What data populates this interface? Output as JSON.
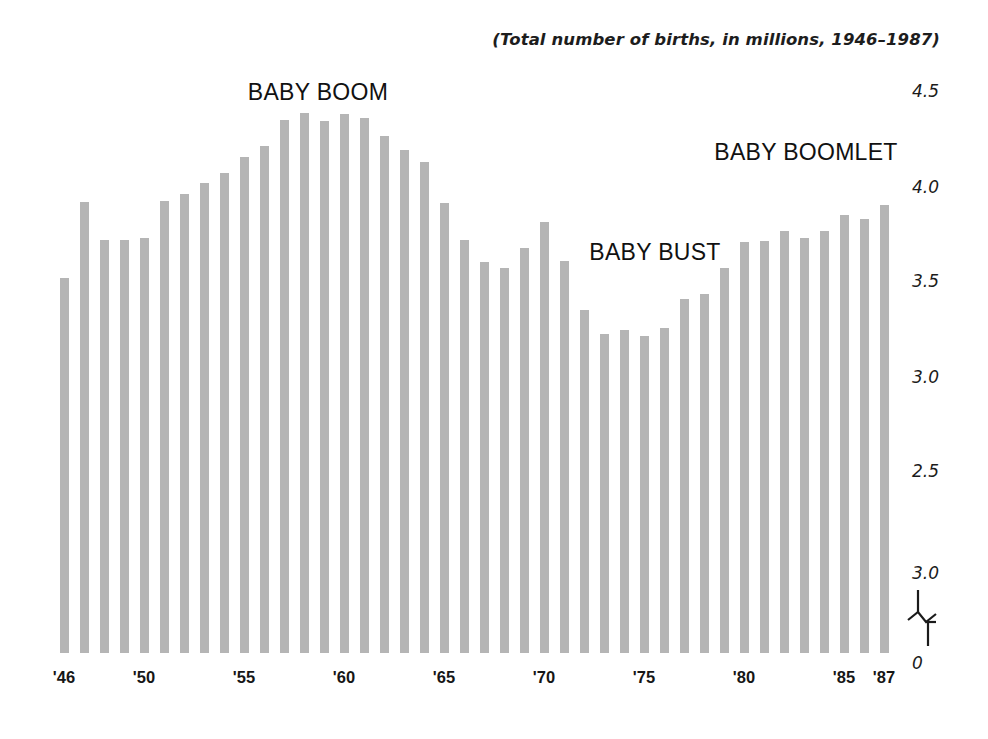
{
  "subtitle": "(Total number of births, in millions, 1946–1987)",
  "colors": {
    "bar": "#b5b5b5",
    "text": "#161616",
    "background": "#ffffff"
  },
  "annotations": [
    {
      "label": "BABY BOOM",
      "x": 318,
      "y": 92
    },
    {
      "label": "BABY BOOMLET",
      "x": 806,
      "y": 152
    },
    {
      "label": "BABY BUST",
      "x": 655,
      "y": 252
    }
  ],
  "y_axis": {
    "ticks": [
      {
        "label": "4.5",
        "y": 91
      },
      {
        "label": "4.0",
        "y": 187
      },
      {
        "label": "3.5",
        "y": 281
      },
      {
        "label": "3.0",
        "y": 377
      },
      {
        "label": "2.5",
        "y": 471
      },
      {
        "label": "3.0",
        "y": 573
      },
      {
        "label": "0",
        "y": 663
      }
    ],
    "has_axis_break": true
  },
  "x_axis": {
    "ticks": [
      {
        "label": "'46",
        "x": 64
      },
      {
        "label": "'50",
        "x": 144
      },
      {
        "label": "'55",
        "x": 244
      },
      {
        "label": "'60",
        "x": 344
      },
      {
        "label": "'65",
        "x": 444
      },
      {
        "label": "'70",
        "x": 544
      },
      {
        "label": "'75",
        "x": 644
      },
      {
        "label": "'80",
        "x": 744
      },
      {
        "label": "'85",
        "x": 844
      },
      {
        "label": "'87",
        "x": 884
      }
    ]
  },
  "chart_data": {
    "type": "bar",
    "title": "",
    "subtitle": "(Total number of births, in millions, 1946–1987)",
    "xlabel": "",
    "ylabel": "",
    "units": "millions of births",
    "ylim": [
      0,
      4.6
    ],
    "grid": false,
    "legend": false,
    "axis_note": "Y axis is broken between the lowest labelled gridline and 0; printed tick sequence reads 4.5, 4.0, 3.5, 3.0, 2.5, 3.0, 0 (the second 3.0 appears to be a typo for 2.0 in the original).",
    "categories": [
      "1946",
      "1947",
      "1948",
      "1949",
      "1950",
      "1951",
      "1952",
      "1953",
      "1954",
      "1955",
      "1956",
      "1957",
      "1958",
      "1959",
      "1960",
      "1961",
      "1962",
      "1963",
      "1964",
      "1965",
      "1966",
      "1967",
      "1968",
      "1969",
      "1970",
      "1971",
      "1972",
      "1973",
      "1974",
      "1975",
      "1976",
      "1977",
      "1978",
      "1979",
      "1980",
      "1981",
      "1982",
      "1983",
      "1984",
      "1985",
      "1986",
      "1987"
    ],
    "tick_labels": [
      "'46",
      "",
      "",
      "",
      "'50",
      "",
      "",
      "",
      "",
      "'55",
      "",
      "",
      "",
      "",
      "'60",
      "",
      "",
      "",
      "",
      "'65",
      "",
      "",
      "",
      "",
      "'70",
      "",
      "",
      "",
      "",
      "'75",
      "",
      "",
      "",
      "",
      "'80",
      "",
      "",
      "",
      "",
      "'85",
      "",
      "'87"
    ],
    "values": [
      3.47,
      3.87,
      3.7,
      3.7,
      3.71,
      3.87,
      3.91,
      3.97,
      4.02,
      4.1,
      4.16,
      4.3,
      4.26,
      4.3,
      4.26,
      4.27,
      4.17,
      4.1,
      4.03,
      3.88,
      3.67,
      3.58,
      3.57,
      3.66,
      3.78,
      3.64,
      3.41,
      3.25,
      3.27,
      3.24,
      3.28,
      3.41,
      3.44,
      3.57,
      3.7,
      3.71,
      3.74,
      3.72,
      3.76,
      3.82,
      3.81,
      3.87
    ]
  },
  "bars": [
    {
      "year": "1946",
      "value": 3.47,
      "x": 60,
      "top": 278
    },
    {
      "year": "1947",
      "value": 3.87,
      "x": 80,
      "top": 202
    },
    {
      "year": "1948",
      "value": 3.7,
      "x": 100,
      "top": 240
    },
    {
      "year": "1949",
      "value": 3.7,
      "x": 120,
      "top": 240
    },
    {
      "year": "1950",
      "value": 3.71,
      "x": 140,
      "top": 238
    },
    {
      "year": "1951",
      "value": 3.87,
      "x": 160,
      "top": 201
    },
    {
      "year": "1952",
      "value": 3.91,
      "x": 180,
      "top": 194
    },
    {
      "year": "1953",
      "value": 3.97,
      "x": 200,
      "top": 183
    },
    {
      "year": "1954",
      "value": 4.02,
      "x": 220,
      "top": 173
    },
    {
      "year": "1955",
      "value": 4.1,
      "x": 240,
      "top": 157
    },
    {
      "year": "1956",
      "value": 4.16,
      "x": 260,
      "top": 146
    },
    {
      "year": "1957",
      "value": 4.3,
      "x": 280,
      "top": 120
    },
    {
      "year": "1958",
      "value": 4.26,
      "x": 300,
      "top": 113
    },
    {
      "year": "1959",
      "value": 4.3,
      "x": 320,
      "top": 121
    },
    {
      "year": "1960",
      "value": 4.26,
      "x": 340,
      "top": 114
    },
    {
      "year": "1961",
      "value": 4.27,
      "x": 360,
      "top": 118
    },
    {
      "year": "1962",
      "value": 4.17,
      "x": 380,
      "top": 136
    },
    {
      "year": "1963",
      "value": 4.1,
      "x": 400,
      "top": 150
    },
    {
      "year": "1964",
      "value": 4.03,
      "x": 420,
      "top": 162
    },
    {
      "year": "1965",
      "value": 3.88,
      "x": 440,
      "top": 203
    },
    {
      "year": "1966",
      "value": 3.67,
      "x": 460,
      "top": 240
    },
    {
      "year": "1967",
      "value": 3.58,
      "x": 480,
      "top": 262
    },
    {
      "year": "1968",
      "value": 3.57,
      "x": 500,
      "top": 268
    },
    {
      "year": "1969",
      "value": 3.66,
      "x": 520,
      "top": 248
    },
    {
      "year": "1970",
      "value": 3.78,
      "x": 540,
      "top": 222
    },
    {
      "year": "1971",
      "value": 3.64,
      "x": 560,
      "top": 261
    },
    {
      "year": "1972",
      "value": 3.41,
      "x": 580,
      "top": 310
    },
    {
      "year": "1973",
      "value": 3.25,
      "x": 600,
      "top": 334
    },
    {
      "year": "1974",
      "value": 3.27,
      "x": 620,
      "top": 330
    },
    {
      "year": "1975",
      "value": 3.24,
      "x": 640,
      "top": 336
    },
    {
      "year": "1976",
      "value": 3.28,
      "x": 660,
      "top": 328
    },
    {
      "year": "1977",
      "value": 3.41,
      "x": 680,
      "top": 299
    },
    {
      "year": "1978",
      "value": 3.44,
      "x": 700,
      "top": 294
    },
    {
      "year": "1979",
      "value": 3.57,
      "x": 720,
      "top": 268
    },
    {
      "year": "1980",
      "value": 3.7,
      "x": 740,
      "top": 242
    },
    {
      "year": "1981",
      "value": 3.71,
      "x": 760,
      "top": 241
    },
    {
      "year": "1982",
      "value": 3.74,
      "x": 780,
      "top": 231
    },
    {
      "year": "1983",
      "value": 3.72,
      "x": 800,
      "top": 238
    },
    {
      "year": "1984",
      "value": 3.76,
      "x": 820,
      "top": 231
    },
    {
      "year": "1985",
      "value": 3.82,
      "x": 840,
      "top": 215
    },
    {
      "year": "1986",
      "value": 3.81,
      "x": 860,
      "top": 219
    },
    {
      "year": "1987",
      "value": 3.87,
      "x": 880,
      "top": 205
    }
  ],
  "geometry": {
    "baseline_y": 653,
    "bar_width": 9
  }
}
